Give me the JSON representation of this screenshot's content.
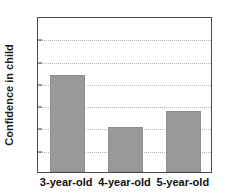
{
  "chart_data": {
    "type": "bar",
    "title": "",
    "subtitle": "",
    "xlabel": "",
    "ylabel": "Confidence in child",
    "categories": [
      "3-year-old",
      "4-year-old",
      "5-year-old"
    ],
    "values": [
      4.35,
      2.0,
      2.72
    ],
    "ylim": [
      0,
      7
    ],
    "ytick_labels": [
      "0",
      "1",
      "2",
      "3",
      "4",
      "5",
      "6",
      "7"
    ],
    "ytick_values": [
      0,
      1,
      2,
      3,
      4,
      5,
      6,
      7
    ],
    "gridlines": [
      1,
      2,
      3,
      4,
      5,
      6
    ],
    "grid": true,
    "grid_style": "dotted",
    "legend": false,
    "legend_position": "none",
    "bar_color": "#999999",
    "bar_edge_color": "#8e8e8e",
    "axis_color": "#4a4a4a",
    "grid_color": "#b5b5b5",
    "text_color": "#111111",
    "background_color": "#ffffff"
  }
}
